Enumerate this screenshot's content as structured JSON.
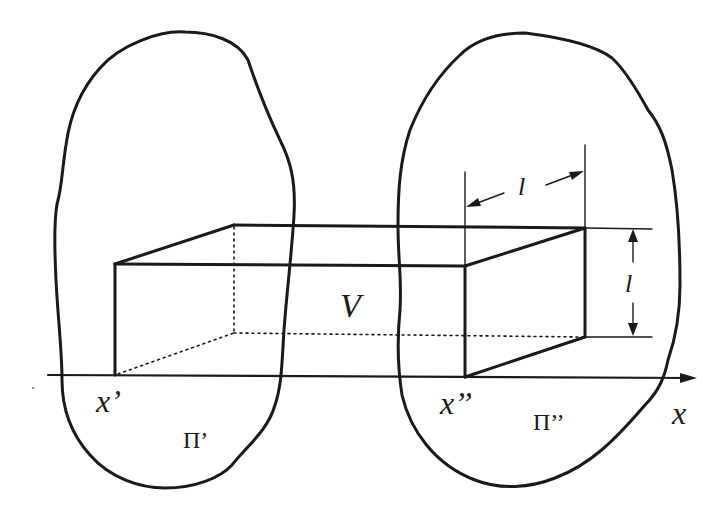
{
  "figure": {
    "type": "geometric-diagram",
    "colors": {
      "ink": "#1a1a1a",
      "background": "#ffffff"
    }
  },
  "labels": {
    "volume": "V",
    "x_prime": "x’",
    "x_double_prime": "x’’",
    "surface_left": "Π’",
    "surface_right": "Π’’",
    "axis": "x",
    "width_dimension": "l",
    "height_dimension": "l"
  }
}
